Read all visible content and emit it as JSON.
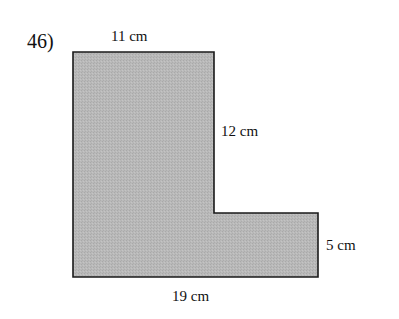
{
  "problem": {
    "number": "46)"
  },
  "figure": {
    "shape": "L-shaped composite rectangle",
    "fill_color": "#b5b5b5",
    "stroke_color": "#1a1a1a",
    "dimensions": {
      "top": "11 cm",
      "right_upper": "12 cm",
      "right_lower": "5 cm",
      "bottom": "19 cm"
    }
  }
}
